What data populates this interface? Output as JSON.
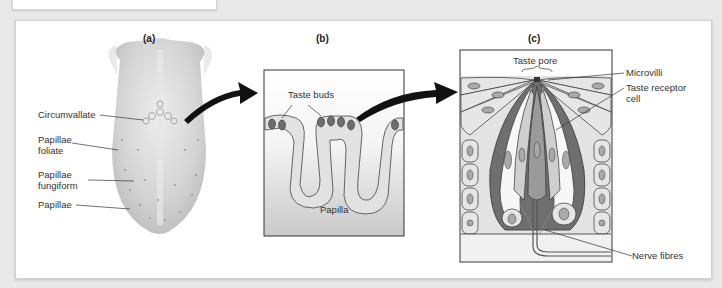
{
  "figure": {
    "panels": [
      {
        "id": "a",
        "label": "(a)"
      },
      {
        "id": "b",
        "label": "(b)"
      },
      {
        "id": "c",
        "label": "(c)"
      }
    ],
    "panel_a": {
      "labels": [
        "Circumvallate",
        "Papillae",
        "foliate",
        "Papillae",
        "fungiform",
        "Papillae"
      ]
    },
    "panel_b": {
      "labels": [
        "Taste buds",
        "Papilla"
      ]
    },
    "panel_c": {
      "labels": [
        "Taste pore",
        "Microvilli",
        "Taste receptor",
        "cell",
        "Nerve fibres"
      ]
    }
  },
  "colors": {
    "background": "#e9e9e9",
    "card": "#ffffff",
    "tongue": "#cfcfcf",
    "papilla_fill": "#e4e4e4",
    "bud": "#6d6d6d",
    "arrow": "#111111"
  }
}
